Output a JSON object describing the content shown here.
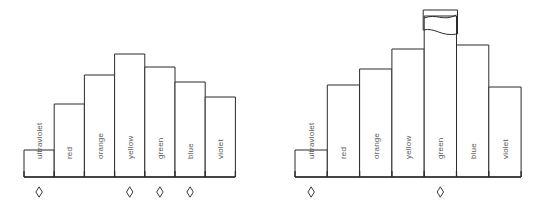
{
  "figure": {
    "title": "",
    "background_color": "#ffffff",
    "line_color": "#2b2b2b",
    "label_color": "#5a5a5a",
    "panel_count": 2
  },
  "chart_data": [
    {
      "type": "bar",
      "id": "left-panel",
      "title": "",
      "xlabel": "",
      "ylabel": "",
      "grid": false,
      "legend": "none",
      "orientation": "vertical",
      "label_rotation": "-90",
      "categories": [
        "ultraviolet",
        "red",
        "orange",
        "yellow",
        "green",
        "blue",
        "violet"
      ],
      "values": [
        27,
        73,
        102,
        123,
        110,
        95,
        80
      ],
      "ylim": [
        0,
        170
      ],
      "bar_fill": "#ffffff",
      "bar_stroke": "#2b2b2b",
      "markers": {
        "shape": "diamond",
        "at_categories": [
          "ultraviolet",
          "yellow",
          "green",
          "blue"
        ]
      }
    },
    {
      "type": "bar",
      "id": "right-panel",
      "title": "",
      "xlabel": "",
      "ylabel": "",
      "grid": false,
      "legend": "none",
      "orientation": "vertical",
      "label_rotation": "-90",
      "categories": [
        "ultraviolet",
        "red",
        "orange",
        "yellow",
        "green",
        "blue",
        "violet"
      ],
      "values": [
        27,
        92,
        108,
        128,
        161,
        132,
        90
      ],
      "ylim": [
        0,
        170
      ],
      "bar_fill": "#ffffff",
      "bar_stroke": "#2b2b2b",
      "broken_bar": {
        "category": "green",
        "note": "axis-break wave across bar top",
        "cap_top": 10,
        "cap_bottom": 32
      },
      "markers": {
        "shape": "diamond",
        "at_categories": [
          "ultraviolet",
          "green"
        ]
      }
    }
  ],
  "labels": {
    "ultraviolet": "ultraviolet",
    "red": "red",
    "orange": "orange",
    "yellow": "yellow",
    "green": "green",
    "blue": "blue",
    "violet": "violet"
  }
}
